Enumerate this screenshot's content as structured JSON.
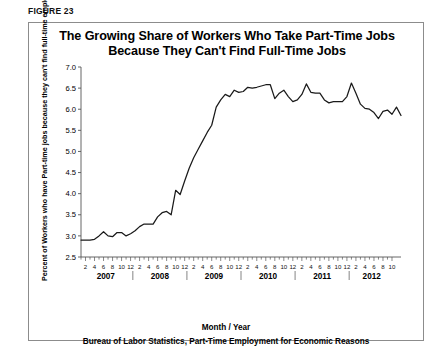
{
  "figure": {
    "label": "FIGURE 23",
    "title_line1": "The Growing Share of Workers Who Take Part-Time Jobs",
    "title_line2": "Because They Can't Find Full-Time Jobs",
    "source_note": "Bureau of Labor Statistics, Part-Time Employment for Economic Reasons"
  },
  "colors": {
    "line": "#1a1a1a",
    "axis": "#555555",
    "frame": "#8c8c8c",
    "background": "#ffffff",
    "text": "#000000"
  },
  "chart_data": {
    "type": "line",
    "title": "The Growing Share of Workers Who Take Part-Time Jobs Because They Can't Find Full-Time Jobs",
    "xlabel": "Month / Year",
    "ylabel": "Percent of Workers who have Part-time jobs because they can't find full-time employment",
    "ylim": [
      2.5,
      7.0
    ],
    "ytick_step": 0.5,
    "ytick_labels": [
      "2.5",
      "3.0",
      "3.5",
      "4.0",
      "4.5",
      "5.0",
      "5.5",
      "6.0",
      "6.5",
      "7.0"
    ],
    "ytick_values": [
      2.5,
      3.0,
      3.5,
      4.0,
      4.5,
      5.0,
      5.5,
      6.0,
      6.5,
      7.0
    ],
    "grid": false,
    "legend": "none",
    "x_month_labels": [
      2,
      4,
      6,
      8,
      10,
      12
    ],
    "years": [
      {
        "year": "2007",
        "months": 12
      },
      {
        "year": "2008",
        "months": 12
      },
      {
        "year": "2009",
        "months": 12
      },
      {
        "year": "2010",
        "months": 12
      },
      {
        "year": "2011",
        "months": 12
      },
      {
        "year": "2012",
        "months": 10
      }
    ],
    "x_start": "2007-01",
    "x_end": "2012-10",
    "series": [
      {
        "name": "Part-time for economic reasons (percent of workers)",
        "values": [
          2.9,
          2.9,
          2.9,
          2.92,
          3.0,
          3.1,
          3.0,
          2.98,
          3.08,
          3.08,
          3.0,
          3.05,
          3.12,
          3.22,
          3.28,
          3.28,
          3.28,
          3.45,
          3.55,
          3.58,
          3.5,
          4.08,
          3.98,
          4.3,
          4.6,
          4.85,
          5.05,
          5.25,
          5.45,
          5.62,
          6.05,
          6.22,
          6.35,
          6.3,
          6.45,
          6.4,
          6.42,
          6.52,
          6.5,
          6.52,
          6.55,
          6.58,
          6.58,
          6.25,
          6.38,
          6.45,
          6.3,
          6.18,
          6.22,
          6.35,
          6.6,
          6.4,
          6.38,
          6.38,
          6.22,
          6.15,
          6.18,
          6.18,
          6.18,
          6.3,
          6.62,
          6.38,
          6.12,
          6.02,
          6.0,
          5.92,
          5.78,
          5.95,
          5.98,
          5.88,
          6.05,
          5.85
        ]
      }
    ]
  }
}
